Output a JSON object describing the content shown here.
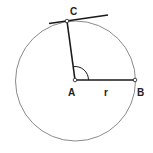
{
  "diagram": {
    "labels": {
      "center": "A",
      "point_on_circle_right": "B",
      "tangent_point": "C",
      "radius": "r"
    },
    "colors": {
      "circle": "#8a8a8a",
      "lines": "#1a1a1a",
      "points_fill": "#ffffff"
    }
  }
}
